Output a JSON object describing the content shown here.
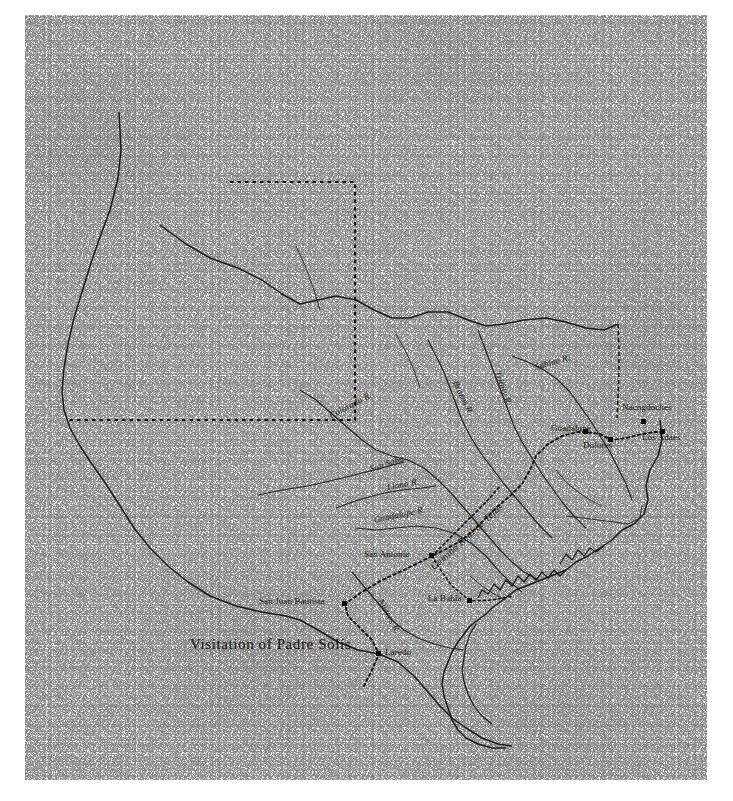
{
  "figure": {
    "name": "historical-map-of-spanish-texas",
    "title": "Visitation of Padre Solís",
    "title_pos": {
      "x": 190,
      "y": 637
    },
    "medium": "halftone scan of printed map",
    "ink_color": "#121212",
    "paper_color": "#fdfdfd"
  },
  "settlements": [
    {
      "name": "San Juan Bautista",
      "x": 259,
      "y": 601,
      "anchor": "left",
      "marker": {
        "x": 345,
        "y": 604
      }
    },
    {
      "name": "Laredo",
      "x": 385,
      "y": 652,
      "anchor": "left",
      "marker": {
        "x": 379,
        "y": 654
      }
    },
    {
      "name": "San Antonio",
      "x": 364,
      "y": 554,
      "anchor": "left",
      "marker": {
        "x": 432,
        "y": 556
      }
    },
    {
      "name": "La Bahía",
      "x": 428,
      "y": 598,
      "anchor": "left",
      "marker": {
        "x": 470,
        "y": 601
      }
    },
    {
      "name": "Guadalupe",
      "x": 551,
      "y": 428,
      "anchor": "left",
      "marker": {
        "x": 586,
        "y": 432
      }
    },
    {
      "name": "Dolores",
      "x": 583,
      "y": 445,
      "anchor": "left",
      "marker": {
        "x": 611,
        "y": 440
      }
    },
    {
      "name": "Nacogdoches",
      "x": 622,
      "y": 407,
      "anchor": "left",
      "marker": {
        "x": 644,
        "y": 422
      }
    },
    {
      "name": "Los Adaes",
      "x": 642,
      "y": 437,
      "anchor": "left",
      "marker": {
        "x": 663,
        "y": 432
      }
    }
  ],
  "rivers": [
    {
      "name": "Colorado R.",
      "x": 330,
      "y": 415,
      "rotate": -28
    },
    {
      "name": "San Saba",
      "x": 370,
      "y": 468,
      "rotate": -18
    },
    {
      "name": "Llano R.",
      "x": 387,
      "y": 486,
      "rotate": -10
    },
    {
      "name": "Guadalupe R.",
      "x": 374,
      "y": 519,
      "rotate": -12
    },
    {
      "name": "Nueces R.",
      "x": 380,
      "y": 598,
      "rotate": 62
    },
    {
      "name": "Brazos R.",
      "x": 455,
      "y": 380,
      "rotate": 64
    },
    {
      "name": "Trinity R.",
      "x": 497,
      "y": 370,
      "rotate": 70
    },
    {
      "name": "Sabine R.",
      "x": 535,
      "y": 366,
      "rotate": -16
    }
  ],
  "routes": [
    {
      "name": "Camino Real de Tejas",
      "x": 432,
      "y": 566,
      "rotate": -42,
      "style": "dotted"
    },
    {
      "name": "Solís visitation route",
      "style": "dotted"
    }
  ],
  "boundaries": [
    {
      "name": "rio-grande-western-boundary",
      "style": "solid"
    },
    {
      "name": "panhandle-boundary",
      "style": "dotted"
    },
    {
      "name": "red-river-northern-boundary",
      "style": "solid"
    },
    {
      "name": "texas-louisiana-eastern-boundary",
      "style": "dashed"
    },
    {
      "name": "gulf-coast-shoreline",
      "style": "solid"
    }
  ]
}
